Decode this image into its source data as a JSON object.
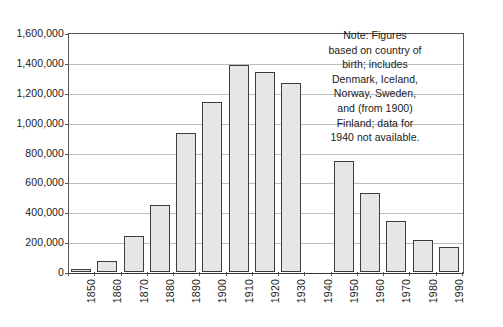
{
  "chart_data": {
    "type": "bar",
    "title": "",
    "subtitle": "",
    "xlabel": "",
    "ylabel": "",
    "categories": [
      "1850",
      "1860",
      "1870",
      "1880",
      "1890",
      "1900",
      "1910",
      "1920",
      "1930",
      "1940",
      "1950",
      "1960",
      "1970",
      "1980",
      "1990"
    ],
    "values": [
      18000,
      72000,
      243000,
      450000,
      933000,
      1140000,
      1385000,
      1340000,
      1263000,
      null,
      742000,
      530000,
      341000,
      217000,
      165000
    ],
    "ylim": [
      0,
      1600000
    ],
    "y_ticks": [
      0,
      200000,
      400000,
      600000,
      800000,
      1000000,
      1200000,
      1400000,
      1600000
    ],
    "y_tick_labels": [
      "0",
      "200,000",
      "400,000",
      "600,000",
      "800,000",
      "1,000,000",
      "1,200,000",
      "1,400,000",
      "1,600,000"
    ],
    "grid": true,
    "legend": "none",
    "missing_categories": [
      "1940"
    ],
    "bar_fill_color": "#e6e6e6",
    "bar_edge_color": "#3d3d3d",
    "gridline_color": "#bdbdbd",
    "axis_color": "#555555"
  },
  "note": {
    "name": "chart-note",
    "lines": [
      "Note: Figures",
      "based on country of",
      "birth; includes",
      "Denmark, Iceland,",
      "Norway, Sweden,",
      "and (from 1900)",
      "Finland; data for",
      "1940 not available."
    ]
  }
}
